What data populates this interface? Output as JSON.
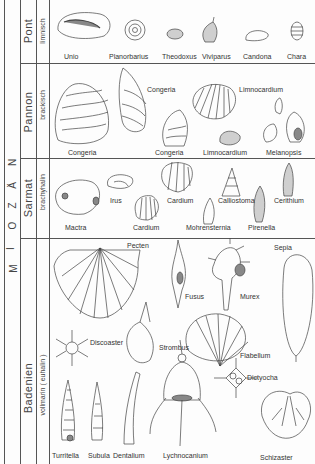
{
  "epoch": {
    "label": "M I O Z Ä N",
    "letters": [
      "M",
      "I",
      "O",
      "Z",
      "Ä",
      "N"
    ]
  },
  "stages": [
    {
      "name": "Pont",
      "environment": "limnisch",
      "y_start": 0,
      "y_end": 63
    },
    {
      "name": "Pannon",
      "environment": "brackisch",
      "y_start": 63,
      "y_end": 158
    },
    {
      "name": "Sarmat",
      "environment": "brachyhalin",
      "y_start": 158,
      "y_end": 238
    },
    {
      "name": "Badenien",
      "environment": "vollmarin ( euhalin )",
      "y_start": 238,
      "y_end": 464
    }
  ],
  "fossils": {
    "pont": [
      "Unio",
      "Planorbarius",
      "Theodoxus",
      "Viviparus",
      "Candona",
      "Chara"
    ],
    "pannon": [
      "Congeria",
      "Congeria",
      "Limnocardium",
      "Congeria",
      "Congeria",
      "Limnocardium",
      "Melanopsis"
    ],
    "sarmat": [
      "Irus",
      "Cardium",
      "Calliostoma",
      "Cerithium",
      "Mactra",
      "Cardium",
      "Mohrensternia",
      "Pirenella"
    ],
    "badenien": [
      "Pecten",
      "Sepia",
      "Fusus",
      "Murex",
      "Discoaster",
      "Strombus",
      "Flabellum",
      "Dictyocha",
      "Turritella",
      "Subula",
      "Dentalium",
      "Lychnocanium",
      "Schizaster"
    ]
  },
  "labels": {
    "unio": "Unio",
    "planorbarius": "Planorbarius",
    "theodoxus": "Theodoxus",
    "viviparus": "Viviparus",
    "candona": "Candona",
    "chara": "Chara",
    "congeria_1": "Congeria",
    "congeria_2": "Congeria",
    "congeria_3": "Congeria",
    "limnocardium_1": "Limnocardium",
    "limnocardium_2": "Limnocardium",
    "melanopsis": "Melanopsis",
    "irus": "Irus",
    "cardium_1": "Cardium",
    "calliostoma": "Calliostoma",
    "cerithium": "Cerithium",
    "mactra": "Mactra",
    "cardium_2": "Cardium",
    "mohrensternia": "Mohrensternia",
    "pirenella": "Pirenella",
    "pecten": "Pecten",
    "sepia": "Sepia",
    "fusus": "Fusus",
    "murex": "Murex",
    "discoaster": "Discoaster",
    "strombus": "Strombus",
    "flabellum": "Flabellum",
    "dictyocha": "Dictyocha",
    "turritella": "Turritella",
    "subula": "Subula",
    "dentalium": "Dentalium",
    "lychnocanium": "Lychnocanium",
    "schizaster": "Schizaster"
  },
  "colors": {
    "line": "#555555",
    "ink": "#333333",
    "paper": "#fdfdfd"
  }
}
